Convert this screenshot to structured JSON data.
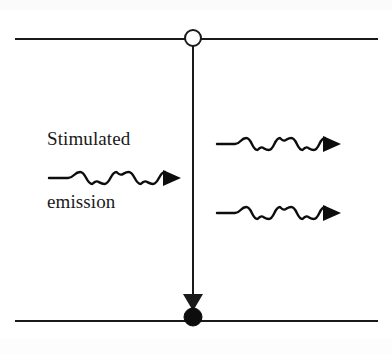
{
  "figure": {
    "background_color": "#ffffff",
    "stroke_color": "#1a1a1a",
    "width": 392,
    "height": 354
  },
  "labels": {
    "stimulated_emission_line1": "Stimulated",
    "stimulated_emission_line2": "emission",
    "stimulated_emission_full": "Stimulated emission"
  },
  "diagram_data": {
    "type": "diagram",
    "subject": "stimulated emission",
    "energy_levels": [
      {
        "name": "upper-energy-level",
        "role": "excited state",
        "y": 39,
        "x_start": 15,
        "x_end": 378,
        "line_width": 2,
        "color": "#1a1a1a"
      },
      {
        "name": "lower-energy-level",
        "role": "ground state",
        "y": 321,
        "x_start": 15,
        "x_end": 378,
        "line_width": 2,
        "color": "#1a1a1a"
      }
    ],
    "electron_markers": [
      {
        "name": "electron-upper-open",
        "fill": "none",
        "stroke": "#1a1a1a",
        "cx": 193,
        "cy": 38,
        "r": 8,
        "state": "vacated"
      },
      {
        "name": "electron-lower-filled",
        "fill": "#0d0d0d",
        "stroke": "#0d0d0d",
        "cx": 193,
        "cy": 317,
        "r": 9,
        "state": "occupied"
      }
    ],
    "transition_arrow": {
      "name": "downward-transition",
      "x": 193,
      "y_start": 46,
      "y_end": 311,
      "direction": "down",
      "head_width": 20,
      "head_height": 17,
      "color": "#1a1a1a"
    },
    "photon_waves": [
      {
        "name": "incident-photon",
        "role": "incoming stimulating photon",
        "x_start": 49,
        "x_end": 181,
        "y": 178,
        "lead_in": 19,
        "cycles": 4,
        "amplitude": 6,
        "arrow_direction": "right",
        "color": "#0d0d0d"
      },
      {
        "name": "emitted-photon-upper",
        "role": "outgoing photon (original)",
        "x_start": 217,
        "x_end": 341,
        "y": 144,
        "lead_in": 18,
        "cycles": 4,
        "amplitude": 6,
        "arrow_direction": "right",
        "color": "#0d0d0d"
      },
      {
        "name": "emitted-photon-lower",
        "role": "outgoing photon (stimulated)",
        "x_start": 217,
        "x_end": 341,
        "y": 213,
        "lead_in": 18,
        "cycles": 4,
        "amplitude": 6,
        "arrow_direction": "right",
        "color": "#0d0d0d"
      }
    ]
  }
}
